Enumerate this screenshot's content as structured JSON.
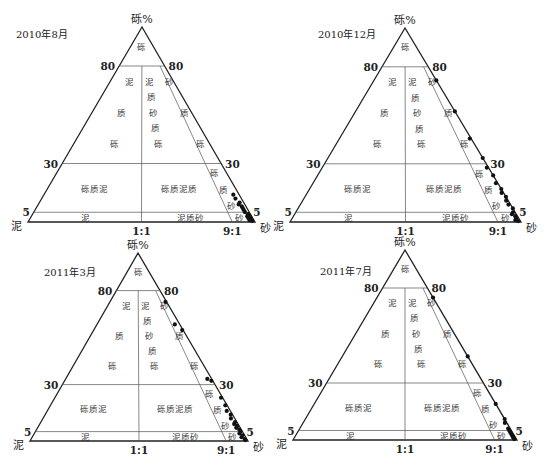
{
  "figure": {
    "apex_label": "砾%",
    "left_vertex_label": "泥",
    "right_vertex_label": "砂",
    "left_ticks": [
      "80",
      "30",
      "5"
    ],
    "right_ticks": [
      "80",
      "30",
      "5"
    ],
    "base_ticks": [
      "1:1",
      "9:1"
    ]
  },
  "region_labels": {
    "gravel": "砾",
    "muddy_gravel": [
      "泥",
      "质",
      "砾"
    ],
    "muddy_sandy_gravel": [
      "泥",
      "质",
      "砂",
      "质",
      "砾"
    ],
    "sandy_gravel": [
      "砂",
      "质",
      "砾"
    ],
    "gravelly_mud": "砾质泥",
    "gravelly_muddy_sand": "砾质泥质",
    "gravelly_sand": [
      "砾",
      "质",
      "砂"
    ],
    "mud": "泥",
    "muddy_sand": "泥质砂",
    "sand": "砂"
  },
  "chart_data": [
    {
      "type": "scatter",
      "subtype": "ternary",
      "title": "2010年8月",
      "axes": {
        "apex": "砾 (gravel %)",
        "left": "泥 (mud)",
        "right": "砂 (sand)"
      },
      "gravel_thresholds": [
        80,
        30,
        5
      ],
      "sand_mud_ratios": [
        "1:1",
        "9:1"
      ],
      "points": [
        {
          "gravel": 14,
          "sand_ratio": 0.97
        },
        {
          "gravel": 12,
          "sand_ratio": 0.97
        },
        {
          "gravel": 10,
          "sand_ratio": 0.98
        },
        {
          "gravel": 9,
          "sand_ratio": 0.97
        },
        {
          "gravel": 8,
          "sand_ratio": 0.98
        },
        {
          "gravel": 7,
          "sand_ratio": 0.98
        },
        {
          "gravel": 6,
          "sand_ratio": 0.98
        },
        {
          "gravel": 5,
          "sand_ratio": 0.98
        },
        {
          "gravel": 4,
          "sand_ratio": 0.99
        },
        {
          "gravel": 3,
          "sand_ratio": 0.98
        },
        {
          "gravel": 3,
          "sand_ratio": 0.99
        },
        {
          "gravel": 2,
          "sand_ratio": 0.99
        },
        {
          "gravel": 2,
          "sand_ratio": 0.98
        },
        {
          "gravel": 1,
          "sand_ratio": 0.99
        },
        {
          "gravel": 1,
          "sand_ratio": 0.98
        },
        {
          "gravel": 0.5,
          "sand_ratio": 0.99
        }
      ]
    },
    {
      "type": "scatter",
      "subtype": "ternary",
      "title": "2010年12月",
      "axes": {
        "apex": "砾 (gravel %)",
        "left": "泥 (mud)",
        "right": "砂 (sand)"
      },
      "gravel_thresholds": [
        80,
        30,
        5
      ],
      "sand_mud_ratios": [
        "1:1",
        "9:1"
      ],
      "points": [
        {
          "gravel": 73,
          "sand_ratio": 1.0
        },
        {
          "gravel": 57,
          "sand_ratio": 1.0
        },
        {
          "gravel": 43,
          "sand_ratio": 0.99
        },
        {
          "gravel": 33,
          "sand_ratio": 1.0
        },
        {
          "gravel": 28,
          "sand_ratio": 0.99
        },
        {
          "gravel": 24,
          "sand_ratio": 1.0
        },
        {
          "gravel": 20,
          "sand_ratio": 0.99
        },
        {
          "gravel": 17,
          "sand_ratio": 1.0
        },
        {
          "gravel": 15,
          "sand_ratio": 0.99
        },
        {
          "gravel": 13,
          "sand_ratio": 1.0
        },
        {
          "gravel": 11,
          "sand_ratio": 0.99
        },
        {
          "gravel": 9,
          "sand_ratio": 0.99
        },
        {
          "gravel": 7,
          "sand_ratio": 1.0
        },
        {
          "gravel": 5,
          "sand_ratio": 0.99
        },
        {
          "gravel": 4,
          "sand_ratio": 0.98
        },
        {
          "gravel": 3,
          "sand_ratio": 0.99
        },
        {
          "gravel": 2,
          "sand_ratio": 0.99
        },
        {
          "gravel": 1,
          "sand_ratio": 0.98
        },
        {
          "gravel": 0.5,
          "sand_ratio": 0.99
        }
      ]
    },
    {
      "type": "scatter",
      "subtype": "ternary",
      "title": "2011年3月",
      "axes": {
        "apex": "砾 (gravel %)",
        "left": "泥 (mud)",
        "right": "砂 (sand)"
      },
      "gravel_thresholds": [
        80,
        30,
        5
      ],
      "sand_mud_ratios": [
        "1:1",
        "9:1"
      ],
      "points": [
        {
          "gravel": 74,
          "sand_ratio": 0.98
        },
        {
          "gravel": 62,
          "sand_ratio": 0.94
        },
        {
          "gravel": 59,
          "sand_ratio": 0.99
        },
        {
          "gravel": 33,
          "sand_ratio": 0.97
        },
        {
          "gravel": 32,
          "sand_ratio": 0.99
        },
        {
          "gravel": 23,
          "sand_ratio": 0.99
        },
        {
          "gravel": 19,
          "sand_ratio": 0.99
        },
        {
          "gravel": 16,
          "sand_ratio": 0.98
        },
        {
          "gravel": 14,
          "sand_ratio": 0.99
        },
        {
          "gravel": 12,
          "sand_ratio": 0.98
        },
        {
          "gravel": 10,
          "sand_ratio": 0.99
        },
        {
          "gravel": 9,
          "sand_ratio": 0.98
        },
        {
          "gravel": 8,
          "sand_ratio": 0.99
        },
        {
          "gravel": 7,
          "sand_ratio": 0.98
        },
        {
          "gravel": 6,
          "sand_ratio": 0.99
        },
        {
          "gravel": 5,
          "sand_ratio": 0.99
        },
        {
          "gravel": 4,
          "sand_ratio": 0.98
        },
        {
          "gravel": 3,
          "sand_ratio": 0.99
        },
        {
          "gravel": 2,
          "sand_ratio": 0.98
        },
        {
          "gravel": 1,
          "sand_ratio": 0.99
        },
        {
          "gravel": 0.5,
          "sand_ratio": 0.99
        }
      ]
    },
    {
      "type": "scatter",
      "subtype": "ternary",
      "title": "2011年7月",
      "axes": {
        "apex": "砾 (gravel %)",
        "left": "泥 (mud)",
        "right": "砂 (sand)"
      },
      "gravel_thresholds": [
        80,
        30,
        5
      ],
      "sand_mud_ratios": [
        "1:1",
        "9:1"
      ],
      "points": [
        {
          "gravel": 75,
          "sand_ratio": 1.0
        },
        {
          "gravel": 44,
          "sand_ratio": 1.0
        },
        {
          "gravel": 19,
          "sand_ratio": 1.0
        },
        {
          "gravel": 11,
          "sand_ratio": 1.0
        },
        {
          "gravel": 9,
          "sand_ratio": 0.99
        },
        {
          "gravel": 6,
          "sand_ratio": 0.99
        },
        {
          "gravel": 5,
          "sand_ratio": 0.99
        },
        {
          "gravel": 4,
          "sand_ratio": 0.99
        },
        {
          "gravel": 3,
          "sand_ratio": 0.99
        },
        {
          "gravel": 2,
          "sand_ratio": 0.99
        },
        {
          "gravel": 1.5,
          "sand_ratio": 0.99
        },
        {
          "gravel": 1,
          "sand_ratio": 0.99
        },
        {
          "gravel": 0.5,
          "sand_ratio": 0.99
        }
      ]
    }
  ],
  "layout": {
    "panels": [
      {
        "apex": [
          142,
          27
        ],
        "left": [
          28,
          222
        ],
        "right": [
          255,
          222
        ],
        "title_pos": [
          16,
          38
        ]
      },
      {
        "apex": [
          405,
          28
        ],
        "left": [
          290,
          222
        ],
        "right": [
          521,
          222
        ],
        "title_pos": [
          318,
          38
        ]
      },
      {
        "apex": [
          138,
          253
        ],
        "left": [
          30,
          441
        ],
        "right": [
          248,
          441
        ],
        "title_pos": [
          44,
          276
        ]
      },
      {
        "apex": [
          405,
          250
        ],
        "left": [
          293,
          440
        ],
        "right": [
          517,
          440
        ],
        "title_pos": [
          320,
          275
        ]
      }
    ],
    "line_color": "#555555",
    "axis_color": "#222222",
    "point_color": "#111111"
  }
}
